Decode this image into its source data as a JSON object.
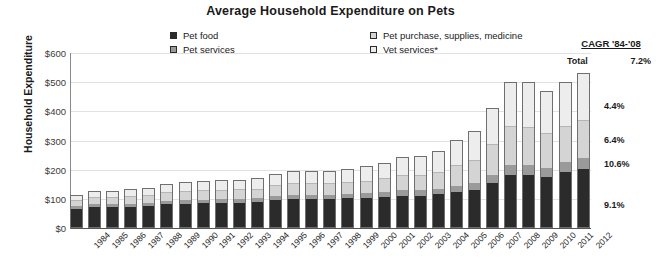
{
  "chart_data": {
    "type": "bar",
    "title": "Average Household Expenditure on Pets",
    "xlabel": "",
    "ylabel": "Household Expenditure",
    "ylim": [
      0,
      600
    ],
    "ytick_labels": [
      "$0",
      "$100",
      "$200",
      "$300",
      "$400",
      "$500",
      "$600"
    ],
    "ytick_values": [
      0,
      100,
      200,
      300,
      400,
      500,
      600
    ],
    "grid": true,
    "stacked": true,
    "legend_position": "top",
    "categories": [
      "1984",
      "1985",
      "1986",
      "1987",
      "1988",
      "1989",
      "1990",
      "1991",
      "1992",
      "1993",
      "1994",
      "1995",
      "1996",
      "1997",
      "1998",
      "1999",
      "2000",
      "2001",
      "2002",
      "2003",
      "2004",
      "2005",
      "2006",
      "2007",
      "2008",
      "2009",
      "2010",
      "2011",
      "2012"
    ],
    "series": [
      {
        "name": "Pet food",
        "color": "#2b2b2b",
        "values": [
          62,
          68,
          68,
          70,
          72,
          78,
          80,
          82,
          84,
          84,
          86,
          92,
          96,
          96,
          96,
          98,
          100,
          104,
          108,
          108,
          112,
          120,
          128,
          152,
          178,
          178,
          172,
          188,
          200
        ]
      },
      {
        "name": "Pet services",
        "color": "#9a9a9a",
        "values": [
          10,
          10,
          10,
          10,
          10,
          12,
          12,
          12,
          12,
          12,
          12,
          14,
          14,
          14,
          14,
          14,
          16,
          16,
          18,
          18,
          20,
          22,
          24,
          28,
          34,
          36,
          32,
          34,
          36
        ]
      },
      {
        "name": "Pet purchase, supplies, medicine",
        "color": "#d4d4d4",
        "values": [
          18,
          20,
          20,
          22,
          24,
          26,
          28,
          28,
          28,
          30,
          30,
          34,
          36,
          36,
          36,
          38,
          40,
          44,
          48,
          50,
          54,
          66,
          74,
          100,
          130,
          126,
          114,
          120,
          126
        ]
      },
      {
        "name": "Vet services*",
        "color": "#ededed",
        "values": [
          14,
          18,
          18,
          20,
          22,
          26,
          28,
          28,
          30,
          30,
          32,
          36,
          40,
          40,
          40,
          42,
          46,
          50,
          58,
          60,
          68,
          84,
          96,
          120,
          148,
          152,
          142,
          148,
          158
        ]
      }
    ],
    "totals": [
      104,
      116,
      116,
      122,
      128,
      142,
      148,
      150,
      154,
      156,
      160,
      176,
      186,
      186,
      186,
      192,
      202,
      214,
      232,
      236,
      254,
      292,
      322,
      400,
      490,
      492,
      460,
      490,
      520
    ]
  },
  "legend": {
    "items": [
      {
        "label": "Pet food",
        "swatch": "swatch-dark"
      },
      {
        "label": "Pet services",
        "swatch": "swatch-mid"
      },
      {
        "label": "Pet purchase, supplies, medicine",
        "swatch": "swatch-light"
      },
      {
        "label": "Vet services*",
        "swatch": "swatch-lightest"
      }
    ]
  },
  "cagr": {
    "heading": "CAGR '84-'08",
    "total_label": "Total",
    "total_value": "7.2%",
    "segment_values": [
      "9.1%",
      "6.4%",
      "10.6%",
      "4.4%"
    ]
  }
}
